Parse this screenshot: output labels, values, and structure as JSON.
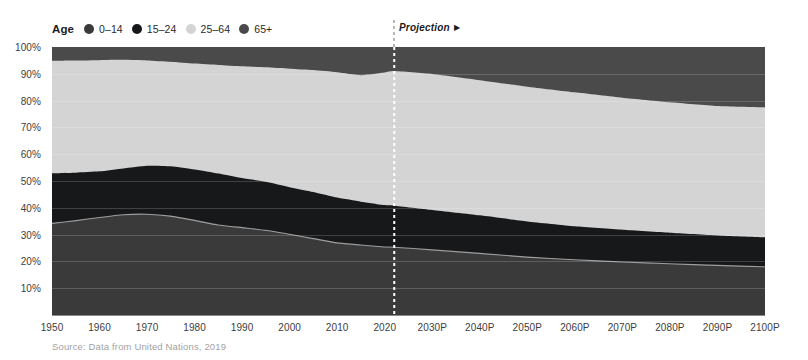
{
  "legend": {
    "title": "Age",
    "items": [
      {
        "label": "0–14",
        "color": "#3a3a3a",
        "icon": "circle-swatch-icon"
      },
      {
        "label": "15–24",
        "color": "#17181a",
        "icon": "circle-swatch-icon"
      },
      {
        "label": "25–64",
        "color": "#d4d4d4",
        "icon": "circle-swatch-icon"
      },
      {
        "label": "65+",
        "color": "#4a4a4a",
        "icon": "circle-swatch-icon"
      }
    ]
  },
  "projection": {
    "label": "Projection",
    "arrow": "▶",
    "divider_year": 2022,
    "divider_color": "#ffffff"
  },
  "source": "Source: Data from United Nations, 2019",
  "axes": {
    "y_ticks": [
      "10%",
      "20%",
      "30%",
      "40%",
      "50%",
      "60%",
      "70%",
      "80%",
      "90%",
      "100%"
    ],
    "x_ticks": [
      "1950",
      "1960",
      "1970",
      "1980",
      "1990",
      "2000",
      "2010",
      "2020",
      "2030P",
      "2040P",
      "2050P",
      "2060P",
      "2070P",
      "2080P",
      "2090P",
      "2100P"
    ]
  },
  "chart_data": {
    "type": "area",
    "stacked": true,
    "normalized": true,
    "title": "",
    "subtitle": "",
    "xlabel": "",
    "ylabel": "",
    "ylim": [
      0,
      100
    ],
    "xlim": [
      1950,
      2100
    ],
    "grid": false,
    "legend_position": "top-left",
    "annotations": [
      {
        "text": "Projection ▶",
        "x": 2022,
        "type": "divider-label"
      }
    ],
    "x": [
      1950,
      1955,
      1960,
      1965,
      1970,
      1975,
      1980,
      1985,
      1990,
      1995,
      2000,
      2005,
      2010,
      2015,
      2020,
      2022,
      2030,
      2040,
      2050,
      2060,
      2070,
      2080,
      2090,
      2100
    ],
    "x_labels": [
      "1950",
      "1955",
      "1960",
      "1965",
      "1970",
      "1975",
      "1980",
      "1985",
      "1990",
      "1995",
      "2000",
      "2005",
      "2010",
      "2015",
      "2020",
      "2022",
      "2030P",
      "2040P",
      "2050P",
      "2060P",
      "2070P",
      "2080P",
      "2090P",
      "2100P"
    ],
    "series": [
      {
        "name": "0–14",
        "color": "#3a3a3a",
        "values": [
          34.2,
          35.2,
          36.4,
          37.4,
          37.6,
          36.9,
          35.3,
          33.6,
          32.6,
          31.6,
          30.1,
          28.5,
          26.9,
          26.1,
          25.4,
          25.3,
          24.3,
          23.0,
          21.6,
          20.6,
          19.8,
          19.1,
          18.5,
          18.0
        ]
      },
      {
        "name": "15–24",
        "color": "#17181a",
        "values": [
          18.7,
          17.9,
          17.2,
          17.3,
          18.1,
          18.6,
          19.0,
          19.2,
          18.5,
          18.1,
          17.6,
          17.4,
          16.9,
          16.2,
          15.6,
          15.5,
          14.9,
          14.2,
          13.3,
          12.5,
          12.0,
          11.6,
          11.2,
          11.0
        ]
      },
      {
        "name": "25–64",
        "color": "#d4d4d4",
        "values": [
          42.0,
          41.9,
          41.5,
          40.5,
          39.3,
          39.0,
          39.5,
          40.5,
          41.7,
          42.7,
          44.2,
          45.5,
          46.8,
          47.2,
          49.5,
          50.2,
          50.7,
          50.4,
          50.3,
          50.0,
          49.3,
          48.7,
          48.3,
          48.5
        ]
      },
      {
        "name": "65+",
        "color": "#4a4a4a",
        "values": [
          5.1,
          5.0,
          4.9,
          4.8,
          5.0,
          5.5,
          6.2,
          6.7,
          7.2,
          7.6,
          8.1,
          8.6,
          9.4,
          10.5,
          9.5,
          9.0,
          10.1,
          12.4,
          14.8,
          16.9,
          18.9,
          20.6,
          22.0,
          22.5
        ]
      }
    ],
    "cumulative_tops": {
      "note": "running top of each stacked band, percent",
      "0–14": [
        34.2,
        35.2,
        36.4,
        37.4,
        37.6,
        36.9,
        35.3,
        33.6,
        32.6,
        31.6,
        30.1,
        28.5,
        26.9,
        26.1,
        25.4,
        25.3,
        24.3,
        23.0,
        21.6,
        20.6,
        19.8,
        19.1,
        18.5,
        18.0
      ],
      "15–24": [
        52.9,
        53.1,
        53.6,
        54.7,
        55.7,
        55.5,
        54.3,
        52.8,
        51.1,
        49.7,
        47.7,
        45.9,
        43.8,
        42.3,
        41.0,
        40.8,
        39.2,
        37.2,
        34.9,
        33.1,
        31.8,
        30.7,
        29.7,
        29.0
      ],
      "25–64": [
        94.9,
        95.0,
        95.1,
        95.2,
        95.0,
        94.5,
        93.8,
        93.3,
        92.8,
        92.4,
        91.9,
        91.4,
        90.6,
        89.5,
        90.5,
        91.0,
        89.9,
        87.6,
        85.2,
        83.1,
        81.1,
        79.4,
        78.0,
        77.5
      ],
      "65+": [
        100,
        100,
        100,
        100,
        100,
        100,
        100,
        100,
        100,
        100,
        100,
        100,
        100,
        100,
        100,
        100,
        100,
        100,
        100,
        100,
        100,
        100,
        100,
        100
      ]
    }
  }
}
